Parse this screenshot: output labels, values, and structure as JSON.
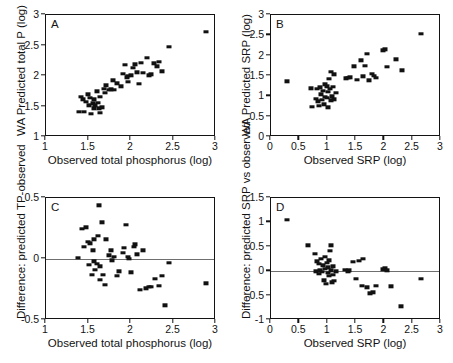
{
  "figure": {
    "panel_count": 4,
    "marker_color": "#111111",
    "axis_color": "#131313",
    "zeroline_color": "#6f6f6f",
    "background": "#ffffff"
  },
  "chart_data": [
    {
      "id": "A",
      "type": "scatter",
      "panel_label": "A",
      "title": "",
      "xlabel": "Observed total phosphorus (log)",
      "ylabel": "WA Predicted total P (log)",
      "xlim": [
        1,
        3
      ],
      "ylim": [
        1,
        3
      ],
      "xticks": [
        1,
        1.5,
        2,
        2.5,
        3
      ],
      "xticklabels": [
        "1",
        "1.5",
        "2",
        "2.5",
        "3"
      ],
      "yticks": [
        1,
        1.5,
        2,
        2.5,
        3
      ],
      "yticklabels": [
        "1",
        "1.5",
        "2",
        "2.5",
        "3"
      ],
      "grid": false,
      "legend": null,
      "zeroline": null,
      "points": [
        [
          1.39,
          1.41
        ],
        [
          1.41,
          1.66
        ],
        [
          1.43,
          1.62
        ],
        [
          1.45,
          1.41
        ],
        [
          1.47,
          1.58
        ],
        [
          1.49,
          1.7
        ],
        [
          1.5,
          1.52
        ],
        [
          1.52,
          1.64
        ],
        [
          1.53,
          1.38
        ],
        [
          1.55,
          1.55
        ],
        [
          1.56,
          1.47
        ],
        [
          1.57,
          1.62
        ],
        [
          1.58,
          1.52
        ],
        [
          1.6,
          1.75
        ],
        [
          1.61,
          1.56
        ],
        [
          1.62,
          1.47
        ],
        [
          1.63,
          1.66
        ],
        [
          1.64,
          1.4
        ],
        [
          1.66,
          1.49
        ],
        [
          1.68,
          1.79
        ],
        [
          1.69,
          1.72
        ],
        [
          1.71,
          1.85
        ],
        [
          1.74,
          1.77
        ],
        [
          1.76,
          1.78
        ],
        [
          1.79,
          1.93
        ],
        [
          1.8,
          1.77
        ],
        [
          1.84,
          1.88
        ],
        [
          1.88,
          1.83
        ],
        [
          1.9,
          2.04
        ],
        [
          1.93,
          2.18
        ],
        [
          1.95,
          1.98
        ],
        [
          1.96,
          2.0
        ],
        [
          1.97,
          1.9
        ],
        [
          2.0,
          2.01
        ],
        [
          2.02,
          2.13
        ],
        [
          2.05,
          2.19
        ],
        [
          2.07,
          2.06
        ],
        [
          2.09,
          1.87
        ],
        [
          2.12,
          2.22
        ],
        [
          2.14,
          2.05
        ],
        [
          2.19,
          2.3
        ],
        [
          2.21,
          2.01
        ],
        [
          2.23,
          2.03
        ],
        [
          2.27,
          2.21
        ],
        [
          2.3,
          2.16
        ],
        [
          2.33,
          2.23
        ],
        [
          2.36,
          2.08
        ],
        [
          2.45,
          2.48
        ],
        [
          2.88,
          2.72
        ]
      ]
    },
    {
      "id": "B",
      "type": "scatter",
      "panel_label": "B",
      "title": "",
      "xlabel": "Observed SRP (log)",
      "ylabel": "WA Predicted SRP (log)",
      "xlim": [
        0,
        3
      ],
      "ylim": [
        0,
        3
      ],
      "xticks": [
        0,
        0.5,
        1,
        1.5,
        2,
        2.5,
        3
      ],
      "xticklabels": [
        "0",
        "0.5",
        "1",
        "1.5",
        "2",
        "2.5",
        "3"
      ],
      "yticks": [
        0,
        0.5,
        1,
        1.5,
        2,
        2.5,
        3
      ],
      "yticklabels": [
        "0",
        "0.5",
        "1",
        "1.5",
        "2",
        "2.5",
        "3"
      ],
      "grid": false,
      "legend": null,
      "zeroline": null,
      "points": [
        [
          0.29,
          1.37
        ],
        [
          0.7,
          1.2
        ],
        [
          0.72,
          0.74
        ],
        [
          0.8,
          0.94
        ],
        [
          0.82,
          1.18
        ],
        [
          0.83,
          0.88
        ],
        [
          0.85,
          0.76
        ],
        [
          0.87,
          1.22
        ],
        [
          0.88,
          1.05
        ],
        [
          0.9,
          0.92
        ],
        [
          0.92,
          1.14
        ],
        [
          0.93,
          0.8
        ],
        [
          0.95,
          1.3
        ],
        [
          0.96,
          0.99
        ],
        [
          0.98,
          1.25
        ],
        [
          0.99,
          0.96
        ],
        [
          1.0,
          1.11
        ],
        [
          1.01,
          0.73
        ],
        [
          1.03,
          1.43
        ],
        [
          1.04,
          1.19
        ],
        [
          1.05,
          0.9
        ],
        [
          1.06,
          1.61
        ],
        [
          1.08,
          1.0
        ],
        [
          1.1,
          1.23
        ],
        [
          1.11,
          1.54
        ],
        [
          1.12,
          0.93
        ],
        [
          1.14,
          1.08
        ],
        [
          1.33,
          1.44
        ],
        [
          1.36,
          1.46
        ],
        [
          1.4,
          1.47
        ],
        [
          1.46,
          1.74
        ],
        [
          1.52,
          1.4
        ],
        [
          1.58,
          1.89
        ],
        [
          1.63,
          1.49
        ],
        [
          1.66,
          1.75
        ],
        [
          1.7,
          2.04
        ],
        [
          1.73,
          1.39
        ],
        [
          1.78,
          1.56
        ],
        [
          1.81,
          1.51
        ],
        [
          1.85,
          1.45
        ],
        [
          1.98,
          2.13
        ],
        [
          2.02,
          2.16
        ],
        [
          2.05,
          1.73
        ],
        [
          2.2,
          1.91
        ],
        [
          2.31,
          1.64
        ],
        [
          2.65,
          2.54
        ]
      ]
    },
    {
      "id": "C",
      "type": "scatter",
      "panel_label": "C",
      "title": "",
      "xlabel": "Observed total phosphorus (log)",
      "ylabel": "Difference: predicted TP-observed",
      "xlim": [
        1,
        3
      ],
      "ylim": [
        -0.5,
        0.5
      ],
      "xticks": [
        1,
        1.5,
        2,
        2.5,
        3
      ],
      "xticklabels": [
        "1",
        "1.5",
        "2",
        "2.5",
        "3"
      ],
      "yticks": [
        -0.5,
        0,
        0.5
      ],
      "yticklabels": [
        "-0.5",
        "0",
        "0.5"
      ],
      "grid": false,
      "legend": null,
      "zeroline": 0,
      "points": [
        [
          1.38,
          0.01
        ],
        [
          1.42,
          0.25
        ],
        [
          1.45,
          0.1
        ],
        [
          1.47,
          0.26
        ],
        [
          1.49,
          0.14
        ],
        [
          1.5,
          -0.05
        ],
        [
          1.52,
          0.13
        ],
        [
          1.54,
          -0.13
        ],
        [
          1.55,
          0.07
        ],
        [
          1.56,
          0.16
        ],
        [
          1.57,
          -0.02
        ],
        [
          1.58,
          -0.09
        ],
        [
          1.6,
          -0.04
        ],
        [
          1.61,
          0.19
        ],
        [
          1.62,
          0.44
        ],
        [
          1.63,
          -0.06
        ],
        [
          1.64,
          -0.17
        ],
        [
          1.66,
          0.3
        ],
        [
          1.67,
          -0.13
        ],
        [
          1.69,
          -0.21
        ],
        [
          1.71,
          0.16
        ],
        [
          1.74,
          0.03
        ],
        [
          1.76,
          0.07
        ],
        [
          1.78,
          -0.01
        ],
        [
          1.8,
          0.02
        ],
        [
          1.83,
          -0.14
        ],
        [
          1.86,
          -0.1
        ],
        [
          1.9,
          0.05
        ],
        [
          1.92,
          0.09
        ],
        [
          1.94,
          0.28
        ],
        [
          1.96,
          0.02
        ],
        [
          1.98,
          0.0
        ],
        [
          2.0,
          -0.11
        ],
        [
          2.03,
          0.1
        ],
        [
          2.05,
          0.12
        ],
        [
          2.07,
          0.04
        ],
        [
          2.1,
          -0.25
        ],
        [
          2.14,
          0.07
        ],
        [
          2.18,
          -0.24
        ],
        [
          2.21,
          -0.23
        ],
        [
          2.24,
          -0.23
        ],
        [
          2.28,
          -0.16
        ],
        [
          2.33,
          -0.22
        ],
        [
          2.36,
          -0.14
        ],
        [
          2.4,
          -0.38
        ],
        [
          2.45,
          -0.03
        ],
        [
          2.88,
          -0.2
        ]
      ]
    },
    {
      "id": "D",
      "type": "scatter",
      "panel_label": "D",
      "title": "",
      "xlabel": "Observed SRP (log)",
      "ylabel": "Difference: predicted SRP vs observed",
      "xlim": [
        0,
        3
      ],
      "ylim": [
        -1,
        1.5
      ],
      "xticks": [
        0,
        0.5,
        1,
        1.5,
        2,
        2.5,
        3
      ],
      "xticklabels": [
        "0",
        "0.5",
        "1",
        "1.5",
        "2",
        "2.5",
        "3"
      ],
      "yticks": [
        -1,
        -0.5,
        0,
        0.5,
        1,
        1.5
      ],
      "yticklabels": [
        "-1",
        "-0.5",
        "0",
        "0.5",
        "1",
        "1.5"
      ],
      "grid": false,
      "legend": null,
      "zeroline": 0,
      "points": [
        [
          0.29,
          1.05
        ],
        [
          0.66,
          0.53
        ],
        [
          0.78,
          0.36
        ],
        [
          0.8,
          0.0
        ],
        [
          0.82,
          0.2
        ],
        [
          0.84,
          0.15
        ],
        [
          0.85,
          -0.05
        ],
        [
          0.87,
          0.02
        ],
        [
          0.88,
          0.25
        ],
        [
          0.9,
          -0.01
        ],
        [
          0.92,
          0.12
        ],
        [
          0.93,
          -0.19
        ],
        [
          0.95,
          0.3
        ],
        [
          0.96,
          0.05
        ],
        [
          0.97,
          -0.26
        ],
        [
          0.99,
          0.17
        ],
        [
          1.0,
          -0.03
        ],
        [
          1.01,
          0.08
        ],
        [
          1.02,
          0.22
        ],
        [
          1.03,
          -0.1
        ],
        [
          1.04,
          0.42
        ],
        [
          1.05,
          0.02
        ],
        [
          1.06,
          0.53
        ],
        [
          1.08,
          -0.23
        ],
        [
          1.09,
          -0.07
        ],
        [
          1.1,
          0.1
        ],
        [
          1.12,
          -0.2
        ],
        [
          1.14,
          0.0
        ],
        [
          1.31,
          0.03
        ],
        [
          1.35,
          -0.01
        ],
        [
          1.38,
          0.02
        ],
        [
          1.45,
          0.19
        ],
        [
          1.5,
          -0.16
        ],
        [
          1.55,
          0.21
        ],
        [
          1.6,
          -0.3
        ],
        [
          1.63,
          0.25
        ],
        [
          1.7,
          -0.33
        ],
        [
          1.75,
          -0.45
        ],
        [
          1.8,
          -0.43
        ],
        [
          1.85,
          -0.3
        ],
        [
          1.98,
          0.04
        ],
        [
          2.02,
          0.06
        ],
        [
          2.05,
          0.02
        ],
        [
          2.12,
          -0.31
        ],
        [
          2.3,
          -0.72
        ],
        [
          2.65,
          -0.15
        ]
      ]
    }
  ]
}
